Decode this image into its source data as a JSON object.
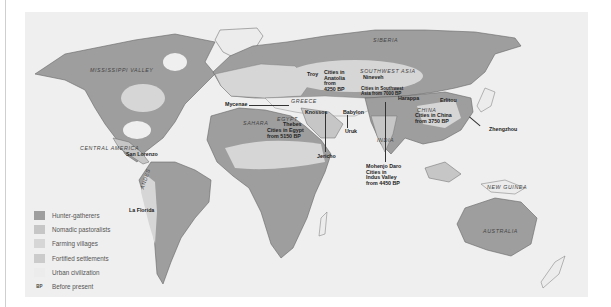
{
  "legend": {
    "items": [
      {
        "label": "Hunter-gatherers",
        "color": "#9e9e9e"
      },
      {
        "label": "Nomadic pastoralists",
        "color": "#c6c6c6"
      },
      {
        "label": "Farming villages",
        "color": "#d6d6d6"
      },
      {
        "label": "Fortified settlements",
        "color": "#cbcbcb"
      },
      {
        "label": "Urban civilization",
        "color": "#ececec"
      }
    ],
    "bp_abbrev": "BP",
    "bp_label": "Before present"
  },
  "regions": {
    "siberia": "SIBERIA",
    "southwest_asia": "SOUTHWEST ASIA",
    "mississippi_valley": "MISSISSIPPI VALLEY",
    "central_america": "CENTRAL AMERICA",
    "andes": "ANDES",
    "sahara": "SAHARA",
    "egypt": "EGYPT",
    "greece": "GREECE",
    "china": "CHINA",
    "india": "INDIA",
    "new_guinea": "NEW GUINEA",
    "australia": "AUSTRALIA"
  },
  "sites": {
    "troy": "Troy",
    "anatolia": "Cities in\nAnatolia\nfrom\n4250 BP",
    "nineveh": "Nineveh",
    "sw_asia_cities": "Cities in Southwest\nAsia from 7000 BP",
    "mycenae": "Mycenae",
    "knossos": "Knossos",
    "babylon": "Babylon",
    "harappa": "Harappa",
    "erlitou": "Erlitou",
    "china_cities": "Cities in China\nfrom 3750 BP",
    "zhengzhou": "Zhengzhou",
    "thebes": "Thebes",
    "egypt_cities": "Cities in Egypt\nfrom 5150 BP",
    "uruk": "Uruk",
    "jericho": "Jericho",
    "mohenjo_daro": "Mohenjo Daro\nCities in\nIndus Valley\nfrom 4450 BP",
    "san_lorenzo": "San Lorenzo",
    "la_florida": "La Florida"
  },
  "colors": {
    "ocean": "#efefef",
    "hunter": "#9e9e9e",
    "nomadic": "#c6c6c6",
    "farming": "#d6d6d6",
    "urban": "#ececec"
  }
}
